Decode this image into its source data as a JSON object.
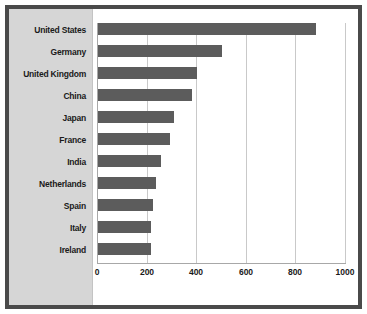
{
  "chart_data": {
    "type": "bar",
    "orientation": "horizontal",
    "title": "",
    "xlabel": "",
    "ylabel": "",
    "categories": [
      "United States",
      "Germany",
      "United Kingdom",
      "China",
      "Japan",
      "France",
      "India",
      "Netherlands",
      "Spain",
      "Italy",
      "Ireland"
    ],
    "values": [
      880,
      500,
      400,
      380,
      305,
      290,
      255,
      235,
      220,
      215,
      215
    ],
    "xlim": [
      0,
      1000
    ],
    "xticks": [
      0,
      200,
      400,
      600,
      800,
      1000
    ],
    "xtick_labels": [
      "0",
      "200",
      "400",
      "600",
      "800",
      "1000"
    ],
    "grid": true,
    "legend": false,
    "bar_color": "#5c5c5c",
    "panel_color": "#d6d6d6",
    "plot_background": "#ffffff",
    "frame_color": "#4a4a4a",
    "gridline_color": "#c9c9c9"
  }
}
